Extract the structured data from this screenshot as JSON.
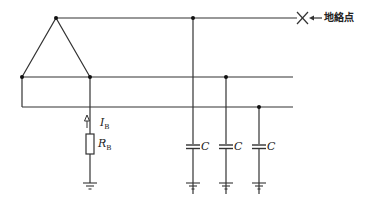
{
  "diagram": {
    "fault_label": "地絡点",
    "current_label": {
      "main": "I",
      "sub": "B"
    },
    "resistor_label": {
      "main": "R",
      "sub": "B"
    },
    "capacitors": [
      {
        "label": "C"
      },
      {
        "label": "C"
      },
      {
        "label": "C"
      }
    ],
    "line_color": "#333333"
  }
}
